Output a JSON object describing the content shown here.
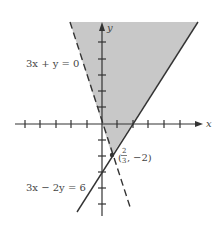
{
  "diagram": {
    "type": "inequality-region-graph",
    "axes": {
      "x_label": "x",
      "y_label": "y"
    },
    "lines": [
      {
        "equation": "3x + y = 0",
        "style": "dashed",
        "label": "3x + y = 0"
      },
      {
        "equation": "3x − 2y = 6",
        "style": "solid",
        "label": "3x − 2y = 6"
      }
    ],
    "intersection": {
      "label_num": "2",
      "label_den": "3",
      "label_y": "−2)",
      "label_open": "(",
      "label_sep": ","
    },
    "shaded_region_color": "#c8c8c8",
    "line_color": "#333333"
  }
}
